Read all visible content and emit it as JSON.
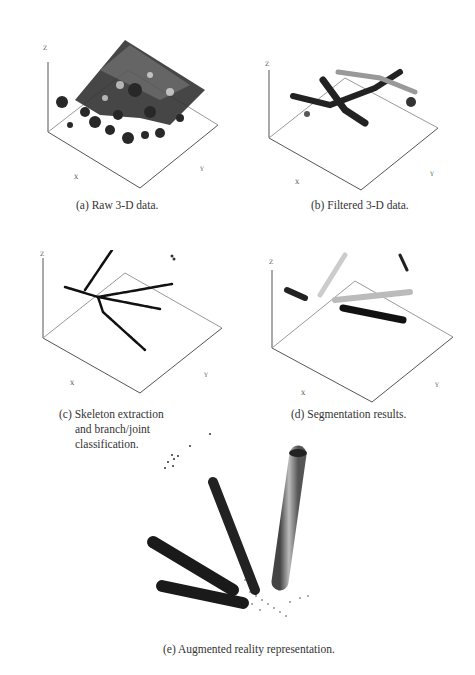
{
  "figure": {
    "panels": [
      {
        "id": "a",
        "caption": "(a) Raw 3-D data.",
        "z_label": "Z",
        "x_label": "X",
        "y_label": "Y",
        "z_ticks": [
          "-200",
          "-300",
          "-400",
          "-500",
          "-600",
          "-700",
          "-800",
          "-900",
          "-1000",
          "-1100",
          "-1200"
        ],
        "x_ticks": [
          "-500",
          "-400",
          "-300",
          "-200",
          "-100",
          "0",
          "100",
          "200",
          "300",
          "400"
        ],
        "y_ticks": [
          "500",
          "400",
          "300",
          "200",
          "100",
          "0",
          "-100",
          "-200",
          "-300",
          "-400"
        ]
      },
      {
        "id": "b",
        "caption": "(b) Filtered 3-D data.",
        "z_label": "Z",
        "x_label": "X",
        "y_label": "Y",
        "z_ticks": [
          "-200",
          "-300",
          "-400",
          "-500",
          "-600",
          "-700",
          "-800",
          "-900",
          "-1000",
          "-1100",
          "-1200"
        ],
        "x_ticks": [
          "-500",
          "-400",
          "-300",
          "-200",
          "-100",
          "0",
          "100",
          "200",
          "300",
          "400"
        ],
        "y_ticks": [
          "500",
          "400",
          "300",
          "200",
          "100",
          "0",
          "-100",
          "-200",
          "-300",
          "-400"
        ]
      },
      {
        "id": "c",
        "caption_lines": [
          "(c) Skeleton extraction",
          "and branch/joint",
          "classification."
        ],
        "z_label": "Z",
        "x_label": "X",
        "y_label": "Y",
        "z_ticks": [
          "-300",
          "-400",
          "-500",
          "-600",
          "-700",
          "-800",
          "-900",
          "-1000",
          "-1100",
          "-1200"
        ],
        "x_ticks": [
          "-300",
          "-200",
          "-100",
          "0",
          "100",
          "200",
          "300",
          "400"
        ],
        "y_ticks": [
          "200",
          "100",
          "0",
          "-100",
          "-200",
          "-300"
        ]
      },
      {
        "id": "d",
        "caption": "(d) Segmentation results.",
        "z_label": "Z",
        "x_label": "X",
        "y_label": "Y",
        "z_ticks": [
          "-300",
          "-400",
          "-500",
          "-600",
          "-700",
          "-800",
          "-900",
          "-1000",
          "-1100",
          "-1200"
        ],
        "x_ticks": [
          "-300",
          "-200",
          "-100",
          "0",
          "100",
          "200",
          "300",
          "400"
        ],
        "y_ticks": [
          "200",
          "100",
          "0",
          "-100",
          "-200",
          "-300"
        ]
      },
      {
        "id": "e",
        "caption": "(e) Augmented reality representation."
      }
    ]
  }
}
